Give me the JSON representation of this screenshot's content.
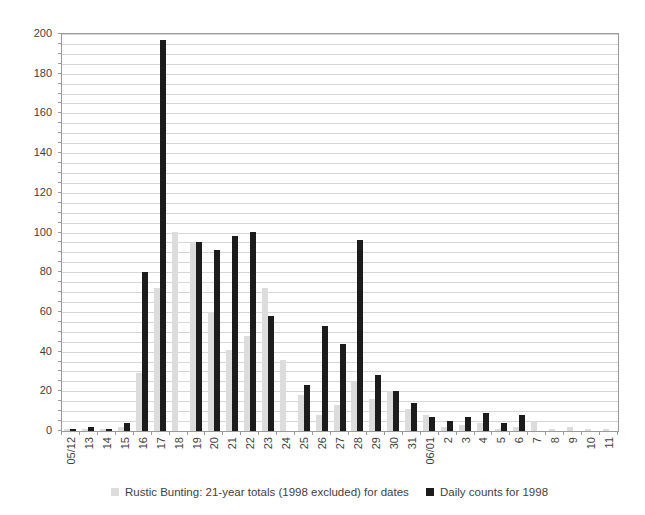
{
  "chart_data": {
    "type": "bar",
    "title": "",
    "categories": [
      "05/12",
      "13",
      "14",
      "15",
      "16",
      "17",
      "18",
      "19",
      "20",
      "21",
      "22",
      "23",
      "24",
      "25",
      "26",
      "27",
      "28",
      "29",
      "30",
      "31",
      "06/01",
      "2",
      "3",
      "4",
      "5",
      "6",
      "7",
      "8",
      "9",
      "10",
      "11"
    ],
    "series": [
      {
        "name": "Rustic Bunting: 21-year totals (1998 excluded) for dates",
        "color": "#dcdcdc",
        "values": [
          1,
          1,
          1,
          2,
          29,
          72,
          100,
          95,
          60,
          41,
          48,
          72,
          36,
          18,
          8,
          13,
          25,
          16,
          20,
          11,
          8,
          2,
          3,
          4,
          1,
          2,
          5,
          1,
          2,
          1,
          1
        ]
      },
      {
        "name": "Daily counts for 1998",
        "color": "#1c1c1c",
        "values": [
          1,
          2,
          1,
          4,
          80,
          197,
          0,
          95,
          91,
          98,
          100,
          58,
          0,
          23,
          53,
          44,
          96,
          28,
          20,
          14,
          7,
          5,
          7,
          9,
          4,
          8,
          0,
          0,
          0,
          0,
          0
        ]
      }
    ],
    "ylim": [
      0,
      200
    ],
    "y_major_step": 20,
    "y_minor_step": 5,
    "xlabel": "",
    "ylabel": "",
    "grid": "horizontal-minor",
    "legend_position": "bottom-center",
    "x_label_rotation_degrees": 90
  },
  "colors": {
    "background": "#ffffff",
    "gridline": "#d6d6d6",
    "plot_border": "#9a9a9a",
    "axis_text": "#3f3f3f",
    "series1_fill": "#dcdcdc",
    "series2_fill": "#1c1c1c"
  },
  "legend": {
    "series1_label": "Rustic Bunting: 21-year totals (1998 excluded) for dates",
    "series2_label": "Daily counts for 1998"
  }
}
